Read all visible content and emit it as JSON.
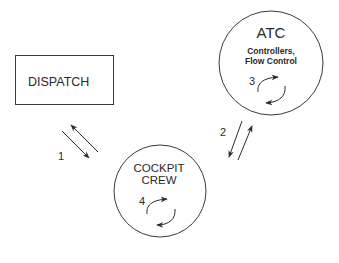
{
  "nodes": {
    "dispatch": {
      "label": "DISPATCH"
    },
    "atc": {
      "title": "ATC",
      "subtitle_line1": "Controllers,",
      "subtitle_line2": "Flow Control",
      "loop_label": "3"
    },
    "cockpit": {
      "line1": "COCKPIT",
      "line2": "CREW",
      "loop_label": "4"
    }
  },
  "links": [
    {
      "label": "1",
      "from": "DISPATCH",
      "to": "COCKPIT CREW",
      "bidirectional": true
    },
    {
      "label": "2",
      "from": "COCKPIT CREW",
      "to": "ATC",
      "bidirectional": true
    }
  ],
  "colors": {
    "stroke": "#3a3a3a",
    "text": "#2a2a2a",
    "background": "#ffffff"
  }
}
